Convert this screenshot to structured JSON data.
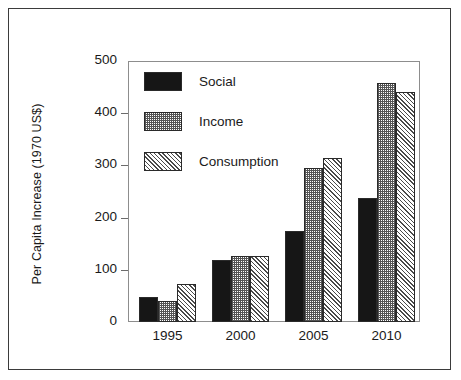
{
  "chart_data": {
    "type": "bar",
    "title": "",
    "xlabel": "",
    "ylabel": "Per Capita Increase (1970 US$)",
    "categories": [
      "1995",
      "2000",
      "2005",
      "2010"
    ],
    "series": [
      {
        "name": "Social",
        "pattern": "solid-black",
        "values": [
          47,
          118,
          175,
          237
        ]
      },
      {
        "name": "Income",
        "pattern": "checkerboard",
        "values": [
          40,
          127,
          295,
          458
        ]
      },
      {
        "name": "Consumption",
        "pattern": "diagonal-hatch",
        "values": [
          73,
          127,
          315,
          440
        ]
      }
    ],
    "ylim": [
      0,
      500
    ],
    "yticks": [
      0,
      100,
      200,
      300,
      400,
      500
    ],
    "ytick_labels": [
      "0",
      "100",
      "200",
      "300",
      "400",
      "500"
    ],
    "grid": false,
    "legend_position": "upper-left-inside",
    "colors": {
      "social": "#161616",
      "income": "#555555",
      "consumption": "#4a4a4a",
      "axis": "#8d8d8d",
      "text": "#1a1a1a",
      "frame": "#3b3b3b",
      "background": "#ffffff"
    }
  }
}
